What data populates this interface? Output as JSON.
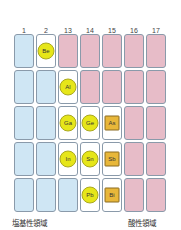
{
  "columns": [
    "1",
    "2",
    "13",
    "14",
    "15",
    "16",
    "17"
  ],
  "rows": [
    [
      "blue",
      {
        "t": "white",
        "el": "Be",
        "shape": "circle"
      },
      "pink",
      "pink",
      "pink",
      "pink",
      "pink"
    ],
    [
      "blue",
      "blue",
      {
        "t": "white",
        "el": "Al",
        "shape": "circle"
      },
      "pink",
      "pink",
      "pink",
      "pink"
    ],
    [
      "blue",
      "blue",
      {
        "t": "white",
        "el": "Ga",
        "shape": "circle"
      },
      {
        "t": "white",
        "el": "Ge",
        "shape": "circle"
      },
      {
        "t": "white",
        "el": "As",
        "shape": "square"
      },
      "pink",
      "pink"
    ],
    [
      "blue",
      "blue",
      {
        "t": "white",
        "el": "In",
        "shape": "circle"
      },
      {
        "t": "white",
        "el": "Sn",
        "shape": "circle"
      },
      {
        "t": "white",
        "el": "Sb",
        "shape": "square"
      },
      "pink",
      "pink"
    ],
    [
      "blue",
      "blue",
      "blue",
      {
        "t": "white",
        "el": "Pb",
        "shape": "circle"
      },
      {
        "t": "white",
        "el": "Bi",
        "shape": "square"
      },
      "pink",
      "pink"
    ]
  ],
  "labels": {
    "basic": "塩基性領域",
    "acidic": "酸性領域"
  },
  "colors": {
    "basic": "#cfe6f4",
    "acidic": "#e7bcc8",
    "amphoteric": "#ffffff",
    "circle": "#e6e619",
    "square": "#e8b73a"
  }
}
